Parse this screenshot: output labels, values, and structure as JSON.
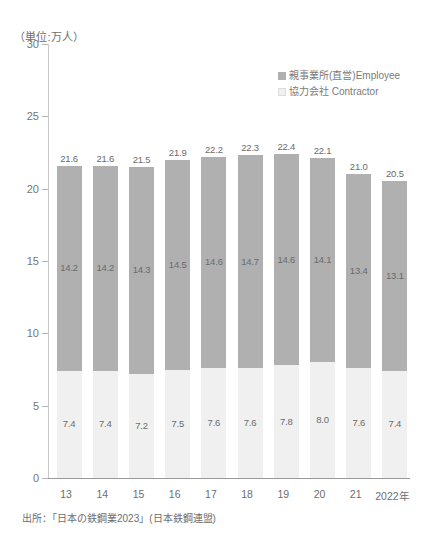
{
  "unit_caption": "（単位:万人）",
  "source_note": "出所：「日本の鉄鋼業2023」(日本鉄鋼連盟)",
  "legend": {
    "items": [
      {
        "label": "親事業所(直営)Employee",
        "color": "#b0b0b0"
      },
      {
        "label": "協力会社 Contractor",
        "color": "#f0f0f0"
      }
    ]
  },
  "colors": {
    "employee": "#b0b0b0",
    "contractor": "#f0f0f0",
    "axis": "#9a9a9a",
    "text": "#6e6e6e"
  },
  "chart_data": {
    "type": "bar",
    "title": "",
    "subtitle": "",
    "xlabel": "",
    "ylabel": "（単位:万人）",
    "stacked": true,
    "grid": false,
    "legend_position": "top-right",
    "ylim": [
      0,
      30
    ],
    "yticks": [
      0,
      5,
      10,
      15,
      20,
      25,
      30
    ],
    "ytick_labels": [
      "0",
      "5",
      "10",
      "15",
      "20",
      "25",
      "30"
    ],
    "categories": [
      "13",
      "14",
      "15",
      "16",
      "17",
      "18",
      "19",
      "20",
      "21",
      "2022年"
    ],
    "series": [
      {
        "name": "協力会社 Contractor",
        "color": "#f0f0f0",
        "values": [
          7.4,
          7.4,
          7.2,
          7.5,
          7.6,
          7.6,
          7.8,
          8.0,
          7.6,
          7.4
        ]
      },
      {
        "name": "親事業所(直営)Employee",
        "color": "#b0b0b0",
        "values": [
          14.2,
          14.2,
          14.3,
          14.5,
          14.6,
          14.7,
          14.6,
          14.1,
          13.4,
          13.1
        ]
      }
    ],
    "totals": [
      21.6,
      21.6,
      21.5,
      21.9,
      22.2,
      22.3,
      22.4,
      22.1,
      21.0,
      20.5
    ],
    "total_labels": [
      "21.6",
      "21.6",
      "21.5",
      "21.9",
      "22.2",
      "22.3",
      "22.4",
      "22.1",
      "21.0",
      "20.5"
    ],
    "employee_labels": [
      "14.2",
      "14.2",
      "14.3",
      "14.5",
      "14.6",
      "14.7",
      "14.6",
      "14.1",
      "13.4",
      "13.1"
    ],
    "contractor_labels": [
      "7.4",
      "7.4",
      "7.2",
      "7.5",
      "7.6",
      "7.6",
      "7.8",
      "8.0",
      "7.6",
      "7.4"
    ]
  }
}
